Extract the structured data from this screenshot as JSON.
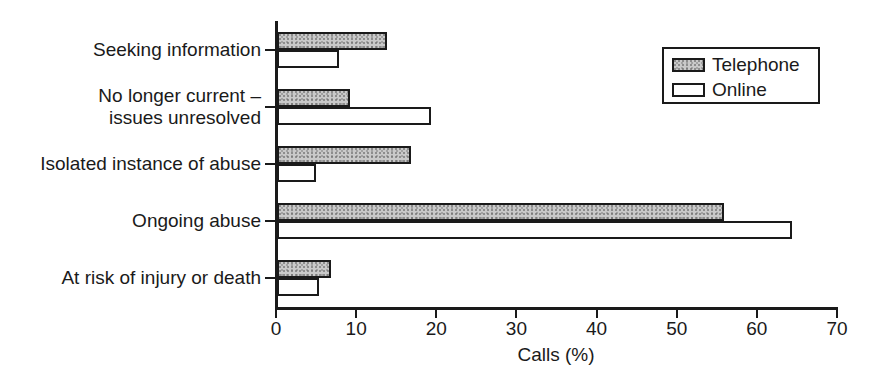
{
  "chart_data": {
    "type": "bar",
    "orientation": "horizontal",
    "title": "",
    "xlabel": "Calls (%)",
    "ylabel": "",
    "xlim": [
      0,
      70
    ],
    "xticks": [
      0,
      10,
      20,
      30,
      40,
      50,
      60,
      70
    ],
    "xtick_labels": [
      "0",
      "10",
      "20",
      "30",
      "40",
      "50",
      "60",
      "70"
    ],
    "grid": false,
    "legend_position": "top-right",
    "categories": [
      "Seeking information",
      "No longer current – issues unresolved",
      "Isolated instance of abuse",
      "Ongoing abuse",
      "At risk of injury or death"
    ],
    "category_label_lines": [
      [
        "Seeking information"
      ],
      [
        "No longer current –",
        "issues unresolved"
      ],
      [
        "Isolated instance of abuse"
      ],
      [
        "Ongoing abuse"
      ],
      [
        "At risk of injury or death"
      ]
    ],
    "series": [
      {
        "name": "Telephone",
        "color": "#c9c9c9",
        "edge_color": "#1a1a1a",
        "values": [
          13.5,
          8.8,
          16.5,
          55.5,
          6.5
        ]
      },
      {
        "name": "Online",
        "color": "#ffffff",
        "edge_color": "#1a1a1a",
        "values": [
          7.5,
          19.0,
          4.6,
          64.0,
          5.0
        ]
      }
    ]
  },
  "legend": {
    "entries": [
      {
        "label": "Telephone",
        "swatch": "filled-gray-swatch"
      },
      {
        "label": "Online",
        "swatch": "empty-white-swatch"
      }
    ]
  },
  "axes": {
    "x_title": "Calls (%)"
  }
}
